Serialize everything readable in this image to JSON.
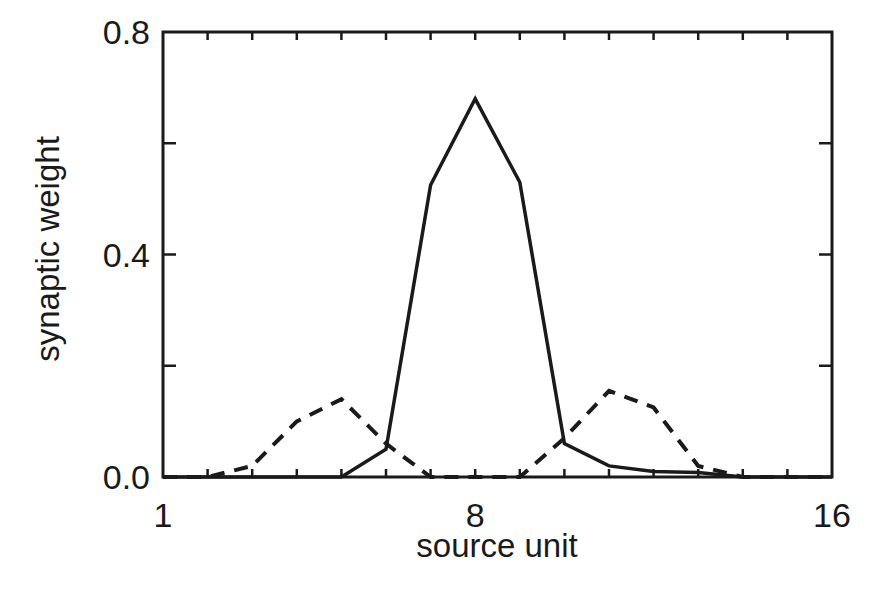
{
  "chart_data": {
    "type": "line",
    "title": "",
    "xlabel": "source unit",
    "ylabel": "synaptic weight",
    "xlim": [
      1,
      16
    ],
    "ylim": [
      0,
      0.8
    ],
    "x_tick_labels": [
      "1",
      "8",
      "16"
    ],
    "x_tick_label_values": [
      1,
      8,
      16
    ],
    "y_tick_labels": [
      "0.0",
      "0.4",
      "0.8"
    ],
    "y_tick_label_values": [
      0.0,
      0.4,
      0.8
    ],
    "y_minor_ticks": [
      0.2,
      0.6
    ],
    "x_minor_ticks": [
      1,
      2,
      3,
      4,
      5,
      6,
      7,
      8,
      9,
      10,
      11,
      12,
      13,
      14,
      15,
      16
    ],
    "grid": false,
    "legend": null,
    "x": [
      1,
      2,
      3,
      4,
      5,
      6,
      7,
      8,
      9,
      10,
      11,
      12,
      13,
      14,
      15,
      16
    ],
    "series": [
      {
        "name": "solid",
        "style": "solid",
        "values": [
          0.0,
          0.0,
          0.0,
          0.0,
          0.0,
          0.05,
          0.525,
          0.68,
          0.53,
          0.06,
          0.02,
          0.01,
          0.008,
          0.0,
          0.0,
          0.0
        ]
      },
      {
        "name": "dashed",
        "style": "dashed",
        "values": [
          0.0,
          0.0,
          0.02,
          0.1,
          0.14,
          0.06,
          0.0,
          0.0,
          0.0,
          0.07,
          0.155,
          0.125,
          0.02,
          0.0,
          0.0,
          0.0
        ]
      }
    ]
  },
  "axes": {
    "xlabel": "source unit",
    "ylabel": "synaptic weight",
    "x_ticks": [
      "1",
      "8",
      "16"
    ],
    "y_ticks": [
      "0.0",
      "0.4",
      "0.8"
    ]
  }
}
